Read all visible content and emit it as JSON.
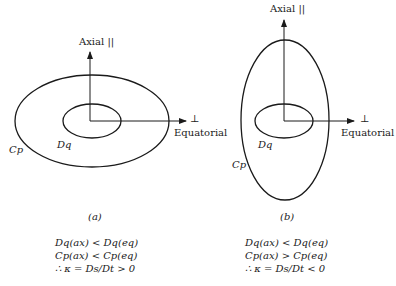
{
  "figure": {
    "panel_a": {
      "axial_label": "Axial ||",
      "equatorial_label": "Equatorial",
      "perp_symbol": "⊥",
      "inner_label": "Dq",
      "outer_label": "Cp",
      "caption": "(a)",
      "equations": [
        "Dq(ax) <  Dq(eq)",
        "Cp(ax) < Cp(eq)",
        "∴ κ = Ds/Dt > 0"
      ]
    },
    "panel_b": {
      "axial_label": "Axial ||",
      "equatorial_label": "Equatorial",
      "perp_symbol": "⊥",
      "inner_label": "Dq",
      "outer_label": "Cp",
      "caption": "(b)",
      "equations": [
        "Dq(ax) < Dq(eq)",
        "Cp(ax) > Cp(eq)",
        "∴ κ = Ds/Dt < 0"
      ]
    }
  }
}
